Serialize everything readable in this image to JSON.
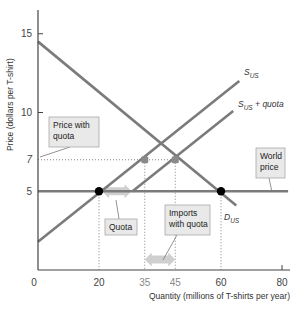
{
  "chart_data": {
    "type": "line",
    "title": "",
    "xlabel": "Quantity (millions of T-shirts per year)",
    "ylabel": "Price (dollars per T-shirt)",
    "xlim": [
      0,
      85
    ],
    "ylim": [
      0,
      17
    ],
    "x_ticks": [
      0,
      20,
      35,
      45,
      60,
      80
    ],
    "y_ticks": [
      5,
      7,
      10,
      15
    ],
    "grid": false,
    "series": [
      {
        "name": "D_US",
        "label_main": "D",
        "label_sub": "US",
        "points": [
          [
            0,
            14.5
          ],
          [
            65,
            4.1
          ]
        ]
      },
      {
        "name": "S_US",
        "label_main": "S",
        "label_sub": "US",
        "points": [
          [
            0,
            1.8
          ],
          [
            66,
            12.0
          ]
        ]
      },
      {
        "name": "S_US + quota",
        "label_main": "S",
        "label_sub": "US",
        "label_suffix": " + quota",
        "points": [
          [
            31,
            5.0
          ],
          [
            64,
            10.1
          ]
        ]
      },
      {
        "name": "World price",
        "points": [
          [
            0,
            5
          ],
          [
            82,
            5
          ]
        ]
      }
    ],
    "markers": [
      {
        "name": "US production at world price",
        "x": 20,
        "y": 5,
        "style": "black-dot"
      },
      {
        "name": "US consumption at world price",
        "x": 60,
        "y": 5,
        "style": "black-dot"
      },
      {
        "name": "US production with quota",
        "x": 35,
        "y": 7,
        "style": "grey-square"
      },
      {
        "name": "US consumption with quota",
        "x": 45,
        "y": 7,
        "style": "grey-square"
      }
    ],
    "guide_lines": [
      {
        "from": [
          0,
          7
        ],
        "to": [
          45,
          7
        ]
      },
      {
        "from": [
          20,
          5
        ],
        "to": [
          20,
          0
        ]
      },
      {
        "from": [
          60,
          5
        ],
        "to": [
          60,
          0
        ]
      },
      {
        "from": [
          35,
          7
        ],
        "to": [
          35,
          0
        ]
      },
      {
        "from": [
          45,
          7
        ],
        "to": [
          45,
          0
        ]
      }
    ],
    "arrows": [
      {
        "name": "quota-arrow",
        "from": 20,
        "to": 31,
        "y": 5
      },
      {
        "name": "imports-with-quota-arrow",
        "from": 35,
        "to": 45,
        "y": 0.8
      }
    ],
    "annotations": [
      {
        "name": "price-with-quota",
        "lines": [
          "Price with",
          "quota"
        ]
      },
      {
        "name": "world-price",
        "lines": [
          "World",
          "price"
        ]
      },
      {
        "name": "quota",
        "lines": [
          "Quota"
        ]
      },
      {
        "name": "imports-with-quota",
        "lines": [
          "Imports",
          "with quota"
        ]
      }
    ]
  },
  "colors": {
    "curve": "#7b7b7b",
    "axis": "#444444",
    "box_fill": "#e9e9e9",
    "box_stroke": "#a8a8a8",
    "arrow": "#cfcfcf",
    "dot": "#000000",
    "square": "#8a8a8a"
  }
}
